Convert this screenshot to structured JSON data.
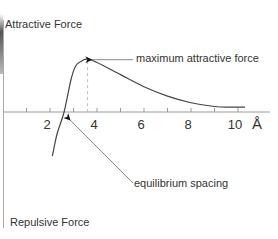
{
  "diagram": {
    "y_axis": {
      "top_label": "Attractive Force",
      "bottom_label": "Repulsive Force"
    },
    "x_axis": {
      "unit": "Å",
      "range": [
        0,
        10.5
      ],
      "tick_step": 1,
      "labeled_ticks": [
        {
          "value": 2,
          "label": "2"
        },
        {
          "value": 4,
          "label": "4"
        },
        {
          "value": 6,
          "label": "6"
        },
        {
          "value": 8,
          "label": "8"
        },
        {
          "value": 10,
          "label": "10"
        }
      ]
    },
    "curve": {
      "description": "net force curve",
      "points": [
        [
          2.1,
          -2.0
        ],
        [
          2.3,
          -1.0
        ],
        [
          2.6,
          0.0
        ],
        [
          2.9,
          1.5
        ],
        [
          3.1,
          2.1
        ],
        [
          3.4,
          2.35
        ],
        [
          3.6,
          2.4
        ],
        [
          4.0,
          2.25
        ],
        [
          5.0,
          1.7
        ],
        [
          6.0,
          1.15
        ],
        [
          7.0,
          0.72
        ],
        [
          8.0,
          0.42
        ],
        [
          9.0,
          0.25
        ],
        [
          9.7,
          0.22
        ],
        [
          10.3,
          0.22
        ]
      ]
    },
    "annotations": {
      "maximum": {
        "label": "maximum attractive force",
        "x": 3.6
      },
      "equilibrium": {
        "label": "equilibrium spacing",
        "x": 2.6
      }
    }
  }
}
